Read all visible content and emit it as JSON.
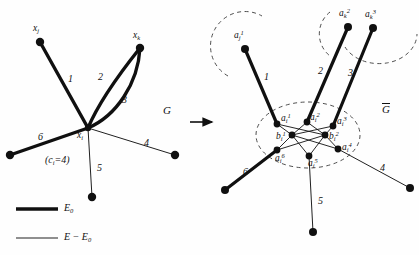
{
  "figure": {
    "background": "#fefefe",
    "ink": "#101010",
    "transition_arrow": "arrow-right"
  },
  "left_graph": {
    "name": "G",
    "center_node_label": "x",
    "center_node_sub": "i",
    "capacity_text_prefix": "(c",
    "capacity_text_sub": "i",
    "capacity_text_suffix": "=4)",
    "nodes": [
      {
        "id": "xj",
        "label": "x",
        "sub": "j",
        "sup": "",
        "x": 40,
        "y": 42
      },
      {
        "id": "xk",
        "label": "x",
        "sub": "k",
        "sup": "",
        "x": 140,
        "y": 48
      },
      {
        "id": "xi",
        "label": "x",
        "sub": "i",
        "sup": "",
        "x": 88,
        "y": 128
      },
      {
        "id": "n6",
        "label": "",
        "sub": "",
        "sup": "",
        "x": 10,
        "y": 155
      },
      {
        "id": "n5",
        "label": "",
        "sub": "",
        "sup": "",
        "x": 92,
        "y": 197
      },
      {
        "id": "n4",
        "label": "",
        "sub": "",
        "sup": "",
        "x": 175,
        "y": 155
      }
    ],
    "edges": [
      {
        "number": "1",
        "thick": true
      },
      {
        "number": "2",
        "thick": true
      },
      {
        "number": "3",
        "thick": true
      },
      {
        "number": "4",
        "thick": false
      },
      {
        "number": "5",
        "thick": false
      },
      {
        "number": "6",
        "thick": true
      }
    ]
  },
  "right_graph": {
    "name": "G",
    "name_overbar": true,
    "outer_nodes": [
      {
        "id": "aj1",
        "label": "a",
        "sub": "j",
        "sup": "1",
        "x": 245,
        "y": 49
      },
      {
        "id": "ak2",
        "label": "a",
        "sub": "k",
        "sup": "2",
        "x": 348,
        "y": 27
      },
      {
        "id": "ak3",
        "label": "a",
        "sub": "k",
        "sup": "3",
        "x": 373,
        "y": 28
      }
    ],
    "cluster_a_nodes": [
      {
        "id": "ai1",
        "label": "a",
        "sub": "i",
        "sup": "1",
        "x": 282,
        "y": 117
      },
      {
        "id": "ai2",
        "label": "a",
        "sub": "i",
        "sup": "2",
        "x": 310,
        "y": 115
      },
      {
        "id": "ai3",
        "label": "a",
        "sub": "i",
        "sup": "3",
        "x": 335,
        "y": 120
      },
      {
        "id": "ai4",
        "label": "a",
        "sub": "i",
        "sup": "4",
        "x": 338,
        "y": 147
      },
      {
        "id": "ai5",
        "label": "a",
        "sub": "i",
        "sup": "5",
        "x": 308,
        "y": 155
      },
      {
        "id": "ai6",
        "label": "a",
        "sub": "i",
        "sup": "6",
        "x": 277,
        "y": 150
      }
    ],
    "cluster_b_nodes": [
      {
        "id": "bi1",
        "label": "b",
        "sub": "i",
        "sup": "1",
        "x": 292,
        "y": 135
      },
      {
        "id": "bi2",
        "label": "b",
        "sub": "i",
        "sup": "2",
        "x": 325,
        "y": 135
      }
    ],
    "leaf_nodes": [
      {
        "id": "r6",
        "x": 225,
        "y": 190
      },
      {
        "id": "r5",
        "x": 313,
        "y": 232
      },
      {
        "id": "r4",
        "x": 410,
        "y": 188
      }
    ],
    "edges": [
      {
        "number": "1",
        "thick": true
      },
      {
        "number": "2",
        "thick": true
      },
      {
        "number": "3",
        "thick": true
      },
      {
        "number": "4",
        "thick": false
      },
      {
        "number": "5",
        "thick": false
      },
      {
        "number": "6",
        "thick": true
      }
    ],
    "dashed_regions": [
      "cluster-i-ellipse",
      "cluster-j-arc",
      "cluster-k-arc"
    ]
  },
  "legend": {
    "items": [
      {
        "style": "thick",
        "label": "E",
        "sub": "0",
        "suffix": ""
      },
      {
        "style": "thin",
        "label": "E",
        "sub": "",
        "suffix": " − E",
        "sub2": "0"
      }
    ],
    "thick_text": "E0",
    "thin_text": "E − E0"
  }
}
